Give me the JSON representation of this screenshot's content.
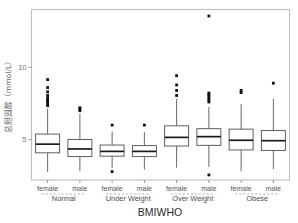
{
  "chart_data": {
    "type": "boxplot",
    "title": "",
    "xlabel": "BMIWHO",
    "ylabel": "总胆固醇（mmol/L）",
    "ylim": [
      2.2,
      14.0
    ],
    "yticks": [
      5,
      10
    ],
    "ytick_labels": [
      "5",
      "10"
    ],
    "grid": false,
    "legend": "none",
    "x_group_labels": [
      "Normal",
      "Under Weight",
      "Over Weight",
      "Obese"
    ],
    "x_sub_labels": [
      "female",
      "male",
      "female",
      "male",
      "female",
      "male",
      "female",
      "male"
    ],
    "boxes": [
      {
        "group": "Normal",
        "sex": "female",
        "whisker_low": 2.75,
        "q1": 4.08,
        "median": 4.68,
        "q3": 5.38,
        "whisker_high": 7.15,
        "outliers": [
          7.35,
          7.5,
          7.62,
          7.72,
          7.85,
          8.05,
          8.3,
          8.6,
          9.15
        ]
      },
      {
        "group": "Normal",
        "sex": "male",
        "whisker_low": 2.8,
        "q1": 3.82,
        "median": 4.35,
        "q3": 5.0,
        "whisker_high": 6.8,
        "outliers": [
          7.0,
          7.12,
          7.2
        ]
      },
      {
        "group": "Under Weight",
        "sex": "female",
        "whisker_low": 3.0,
        "q1": 3.85,
        "median": 4.18,
        "q3": 4.62,
        "whisker_high": 5.55,
        "outliers": [
          2.78,
          6.0
        ]
      },
      {
        "group": "Under Weight",
        "sex": "male",
        "whisker_low": 2.92,
        "q1": 3.82,
        "median": 4.18,
        "q3": 4.58,
        "whisker_high": 5.5,
        "outliers": [
          6.0
        ]
      },
      {
        "group": "Over Weight",
        "sex": "female",
        "whisker_low": 3.05,
        "q1": 4.55,
        "median": 5.15,
        "q3": 5.95,
        "whisker_high": 7.82,
        "outliers": [
          8.05,
          8.4,
          8.78,
          9.42
        ]
      },
      {
        "group": "Over Weight",
        "sex": "male",
        "whisker_low": 3.1,
        "q1": 4.6,
        "median": 5.2,
        "q3": 5.75,
        "whisker_high": 7.25,
        "outliers": [
          2.55,
          7.6,
          7.72,
          7.85,
          7.98,
          8.1,
          8.22,
          13.55
        ]
      },
      {
        "group": "Obese",
        "sex": "female",
        "whisker_low": 2.8,
        "q1": 4.28,
        "median": 4.95,
        "q3": 5.72,
        "whisker_high": 7.45,
        "outliers": [
          8.25,
          8.4
        ]
      },
      {
        "group": "Obese",
        "sex": "male",
        "whisker_low": 2.95,
        "q1": 4.25,
        "median": 4.92,
        "q3": 5.62,
        "whisker_high": 7.82,
        "outliers": [
          8.9
        ]
      }
    ],
    "colors": {
      "box_fill": "#ffffff",
      "box_stroke": "#4d4d4d",
      "median": "#1a1a1a",
      "outlier": "#111111",
      "panel_border": "#bdbdbd",
      "tick_label": "#7a7a7a",
      "axis_title": "#2b2b2b",
      "background": "#ffffff"
    }
  }
}
